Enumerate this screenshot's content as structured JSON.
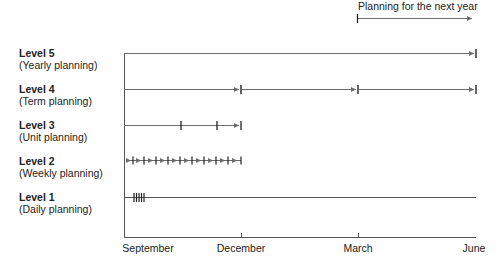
{
  "header": {
    "next_year_note": "Planning for the next year"
  },
  "levels": [
    {
      "level": "Level 5",
      "description": "(Yearly planning)"
    },
    {
      "level": "Level 4",
      "description": "(Term planning)"
    },
    {
      "level": "Level 3",
      "description": "(Unit planning)"
    },
    {
      "level": "Level 2",
      "description": "(Weekly planning)"
    },
    {
      "level": "Level 1",
      "description": "(Daily planning)"
    }
  ],
  "axis": {
    "months": [
      "September",
      "December",
      "March",
      "June"
    ]
  },
  "colors": {
    "line": "#6b6b6b",
    "tick": "#222222",
    "text": "#222222"
  }
}
